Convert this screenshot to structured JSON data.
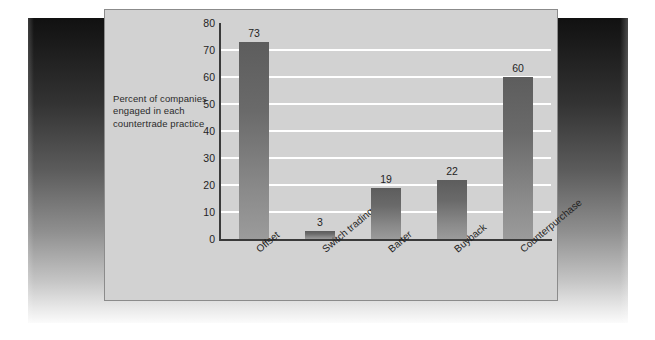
{
  "caption": {
    "text": "Percent of companies engaged in each countertrade practice"
  },
  "colors": {
    "panel_background": "#d2d2d2",
    "panel_border": "#8b8b8b",
    "bar_top": "#5d5d5d",
    "bar_bottom": "#9b9b9b",
    "gridline": "#ffffff",
    "axis": "#3a3a3a",
    "text": "#1f1f1f"
  },
  "chart_data": {
    "type": "bar",
    "title": "",
    "xlabel": "",
    "ylabel": "Percent of companies engaged in each countertrade practice",
    "categories": [
      "Offset",
      "Switch trading",
      "Barter",
      "Buyback",
      "Counterpurchase"
    ],
    "values": [
      73,
      3,
      19,
      22,
      60
    ],
    "value_labels": [
      "73",
      "3",
      "19",
      "22",
      "60"
    ],
    "ylim": [
      0,
      80
    ],
    "yticks": [
      0,
      10,
      20,
      30,
      40,
      50,
      60,
      70,
      80
    ],
    "ytick_labels": [
      "0",
      "10",
      "20",
      "30",
      "40",
      "50",
      "60",
      "70",
      "80"
    ],
    "grid": true,
    "grid_orientation": "horizontal",
    "legend": "none",
    "category_label_rotation_deg": -40
  }
}
